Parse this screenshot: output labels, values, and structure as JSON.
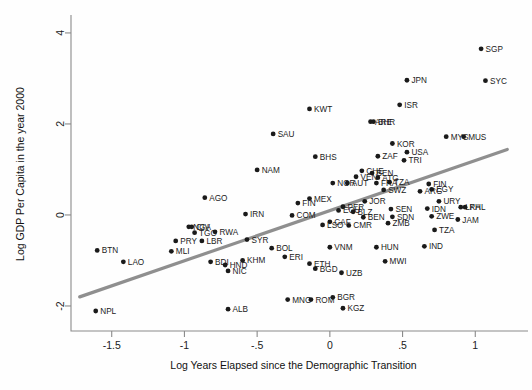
{
  "chart_data": {
    "type": "scatter",
    "title": "",
    "xlabel": "Log Years Elapsed since the Demographic Transition",
    "ylabel": "Log GDP Per Capita in the year 2000",
    "xlim": [
      -1.78,
      1.28
    ],
    "ylim": [
      -2.55,
      4.35
    ],
    "xticks": [
      -1.5,
      -1,
      -0.5,
      0,
      0.5,
      1
    ],
    "xticklabels": [
      "-1.5",
      "-1",
      "-.5",
      "0",
      ".5",
      "1"
    ],
    "yticks": [
      4,
      2,
      0,
      -2
    ],
    "yticklabels": [
      "4",
      "2",
      "0",
      "-2"
    ],
    "grid": false,
    "legend": null,
    "marker_color": "#1a1a1a",
    "fit_line_color": "#8f8f8f",
    "fit_line": {
      "x0": -1.72,
      "y0": -1.8,
      "x1": 1.22,
      "y1": 1.44
    },
    "points": [
      {
        "label": "SGP",
        "x": 1.04,
        "y": 3.65
      },
      {
        "label": "SYC",
        "x": 1.07,
        "y": 2.95
      },
      {
        "label": "JPN",
        "x": 0.53,
        "y": 2.96
      },
      {
        "label": "ISR",
        "x": 0.48,
        "y": 2.42
      },
      {
        "label": "KWT",
        "x": -0.14,
        "y": 2.33
      },
      {
        "label": "ARE",
        "x": 0.28,
        "y": 2.05
      },
      {
        "label": "BHR",
        "x": 0.3,
        "y": 2.05
      },
      {
        "label": "SAU",
        "x": -0.39,
        "y": 1.78
      },
      {
        "label": "KOR",
        "x": 0.43,
        "y": 1.57
      },
      {
        "label": "MYS",
        "x": 0.8,
        "y": 1.72
      },
      {
        "label": "MUS",
        "x": 0.92,
        "y": 1.72
      },
      {
        "label": "USA",
        "x": 0.53,
        "y": 1.38
      },
      {
        "label": "TRI",
        "x": 0.51,
        "y": 1.2
      },
      {
        "label": "BHS",
        "x": -0.1,
        "y": 1.28
      },
      {
        "label": "ZAF",
        "x": 0.33,
        "y": 1.29
      },
      {
        "label": "NAM",
        "x": -0.5,
        "y": 0.99
      },
      {
        "label": "CHE",
        "x": 0.22,
        "y": 0.97
      },
      {
        "label": "VEN",
        "x": 0.18,
        "y": 0.84
      },
      {
        "label": "BEN2",
        "x": 0.29,
        "y": 0.92
      },
      {
        "label": "ATG",
        "x": 0.33,
        "y": 0.82
      },
      {
        "label": "NOR",
        "x": 0.02,
        "y": 0.7
      },
      {
        "label": "AUT",
        "x": 0.12,
        "y": 0.7
      },
      {
        "label": "FRA",
        "x": 0.32,
        "y": 0.7
      },
      {
        "label": "TZA2",
        "x": 0.41,
        "y": 0.72
      },
      {
        "label": "FIN2",
        "x": 0.68,
        "y": 0.68
      },
      {
        "label": "EGY",
        "x": 0.7,
        "y": 0.56
      },
      {
        "label": "SWZ",
        "x": 0.37,
        "y": 0.55
      },
      {
        "label": "ARG",
        "x": 0.62,
        "y": 0.52
      },
      {
        "label": "MEX",
        "x": -0.14,
        "y": 0.36
      },
      {
        "label": "FIN",
        "x": -0.22,
        "y": 0.26
      },
      {
        "label": "JOR",
        "x": 0.24,
        "y": 0.3
      },
      {
        "label": "URY",
        "x": 0.75,
        "y": 0.3
      },
      {
        "label": "IDN",
        "x": 0.67,
        "y": 0.14
      },
      {
        "label": "LKA",
        "x": 0.9,
        "y": 0.17
      },
      {
        "label": "PHL",
        "x": 0.93,
        "y": 0.17
      },
      {
        "label": "AGO",
        "x": -0.86,
        "y": 0.38
      },
      {
        "label": "PER",
        "x": 0.09,
        "y": 0.18
      },
      {
        "label": "ECU",
        "x": 0.06,
        "y": 0.1
      },
      {
        "label": "BLZ",
        "x": 0.16,
        "y": 0.07
      },
      {
        "label": "SEN",
        "x": 0.42,
        "y": 0.13
      },
      {
        "label": "ZWE",
        "x": 0.7,
        "y": -0.03
      },
      {
        "label": "JAM",
        "x": 0.88,
        "y": -0.1
      },
      {
        "label": "COM",
        "x": -0.26,
        "y": -0.01
      },
      {
        "label": "IRN",
        "x": -0.58,
        "y": 0.02
      },
      {
        "label": "BEN",
        "x": 0.23,
        "y": -0.05
      },
      {
        "label": "SDN",
        "x": 0.43,
        "y": -0.04
      },
      {
        "label": "ZMB",
        "x": 0.4,
        "y": -0.18
      },
      {
        "label": "CAF",
        "x": 0.0,
        "y": -0.15
      },
      {
        "label": "LSO",
        "x": -0.05,
        "y": -0.22
      },
      {
        "label": "CMR",
        "x": 0.13,
        "y": -0.23
      },
      {
        "label": "TZA",
        "x": 0.72,
        "y": -0.33
      },
      {
        "label": "NGA",
        "x": -0.97,
        "y": -0.26
      },
      {
        "label": "CIV",
        "x": -0.95,
        "y": -0.26
      },
      {
        "label": "TGO",
        "x": -0.93,
        "y": -0.39
      },
      {
        "label": "RWA",
        "x": -0.79,
        "y": -0.37
      },
      {
        "label": "SYR",
        "x": -0.57,
        "y": -0.54
      },
      {
        "label": "PRY",
        "x": -1.06,
        "y": -0.57
      },
      {
        "label": "LBR",
        "x": -0.88,
        "y": -0.57
      },
      {
        "label": "MLI",
        "x": -1.09,
        "y": -0.8
      },
      {
        "label": "BTN",
        "x": -1.6,
        "y": -0.78
      },
      {
        "label": "LAO",
        "x": -1.42,
        "y": -1.03
      },
      {
        "label": "BDI",
        "x": -0.82,
        "y": -1.03
      },
      {
        "label": "KHM",
        "x": -0.6,
        "y": -1.0
      },
      {
        "label": "HND",
        "x": -0.72,
        "y": -1.1
      },
      {
        "label": "NIC",
        "x": -0.7,
        "y": -1.23
      },
      {
        "label": "BOL",
        "x": -0.4,
        "y": -0.73
      },
      {
        "label": "ERI",
        "x": -0.31,
        "y": -0.92
      },
      {
        "label": "ETH",
        "x": -0.14,
        "y": -1.07
      },
      {
        "label": "BGD",
        "x": -0.1,
        "y": -1.18
      },
      {
        "label": "VNM",
        "x": 0.0,
        "y": -0.71
      },
      {
        "label": "HUN",
        "x": 0.32,
        "y": -0.71
      },
      {
        "label": "IND",
        "x": 0.65,
        "y": -0.69
      },
      {
        "label": "MWI",
        "x": 0.38,
        "y": -1.02
      },
      {
        "label": "UZB",
        "x": 0.08,
        "y": -1.27
      },
      {
        "label": "NPL",
        "x": -1.61,
        "y": -2.11
      },
      {
        "label": "MNG",
        "x": -0.29,
        "y": -1.86
      },
      {
        "label": "ROM",
        "x": -0.13,
        "y": -1.86
      },
      {
        "label": "BGR",
        "x": 0.02,
        "y": -1.81
      },
      {
        "label": "KGZ",
        "x": 0.09,
        "y": -2.05
      },
      {
        "label": "ALB",
        "x": -0.7,
        "y": -2.07
      }
    ]
  },
  "axes": {
    "ylabel": "Log GDP Per Capita in the year 2000",
    "xlabel": "Log Years Elapsed since the Demographic Transition"
  }
}
